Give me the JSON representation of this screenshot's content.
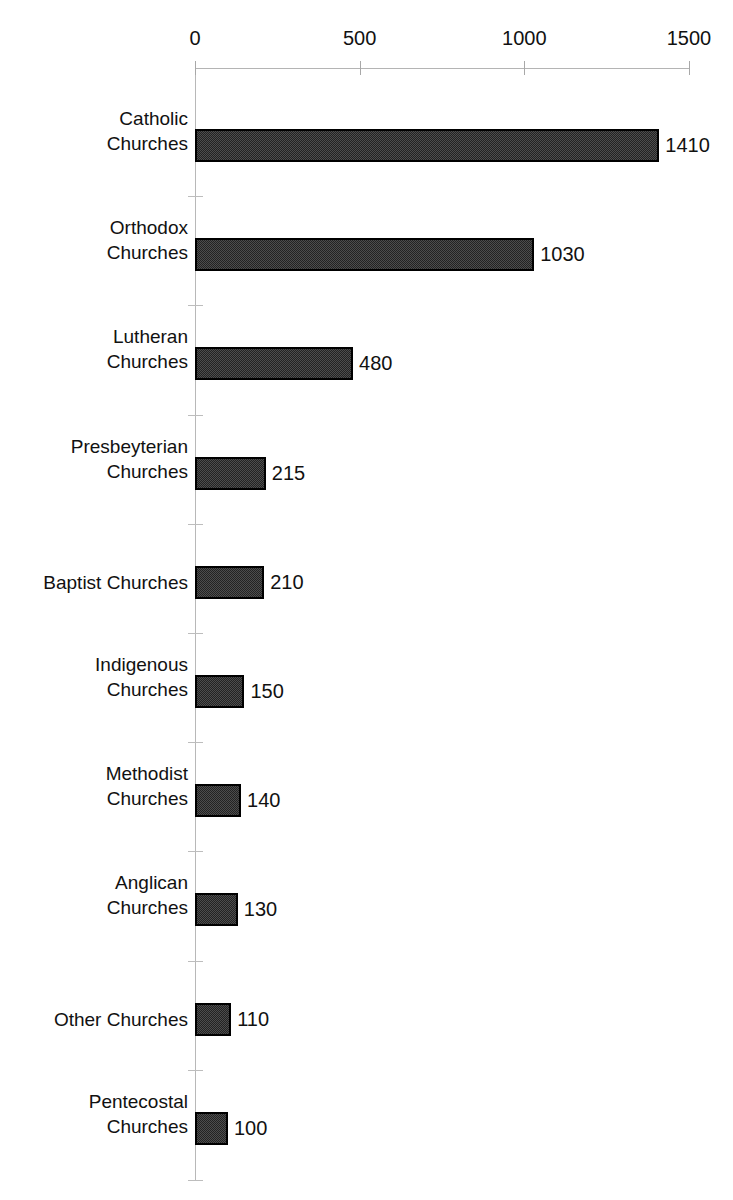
{
  "chart_data": {
    "type": "bar",
    "orientation": "horizontal",
    "title": "",
    "xlabel": "",
    "ylabel": "",
    "xlim": [
      0,
      1500
    ],
    "xticks": [
      0,
      500,
      1000,
      1500
    ],
    "xtick_labels": [
      "0",
      "500",
      "1000",
      "1500"
    ],
    "grid": false,
    "legend": false,
    "axis_position": "top",
    "bar_fill_color": "#4d4d4d",
    "bar_border_color": "#000000",
    "axis_color": "#b4b4b4",
    "categories": [
      "Catholic\nChurches",
      "Orthodox\nChurches",
      "Lutheran\nChurches",
      "Presbeyterian\nChurches",
      "Baptist Churches",
      "Indigenous\nChurches",
      "Methodist\nChurches",
      "Anglican\nChurches",
      "Other Churches",
      "Pentecostal\nChurches"
    ],
    "values": [
      1410,
      1030,
      480,
      215,
      210,
      150,
      140,
      130,
      110,
      100
    ],
    "value_labels": [
      "1410",
      "1030",
      "480",
      "215",
      "210",
      "150",
      "140",
      "130",
      "110",
      "100"
    ]
  }
}
